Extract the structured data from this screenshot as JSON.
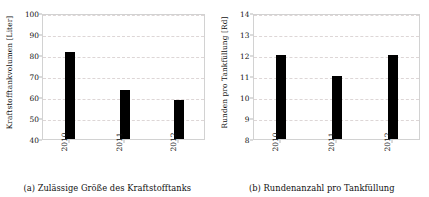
{
  "figure": {
    "background": "#ffffff",
    "bar_color": "#000000",
    "grid_color": "#ddd6d6",
    "frame_color": "#d2d2d2"
  },
  "subfigures": [
    {
      "id": "subfigure-a",
      "caption": "(a) Zulässige Größe des Kraftstofftanks",
      "chart_data": {
        "type": "bar",
        "title": "",
        "xlabel": "",
        "ylabel": "Kraftstofftankvolumen [Liter]",
        "categories": [
          "2010",
          "2011",
          "2012"
        ],
        "values": [
          81.5,
          63.5,
          58.5
        ],
        "ylim": [
          40,
          100
        ],
        "yticks": [
          40,
          50,
          60,
          70,
          80,
          90,
          100
        ],
        "yticklabels": [
          "40",
          "50",
          "60",
          "70",
          "80",
          "90",
          "100"
        ],
        "grid": true,
        "legend": "none"
      }
    },
    {
      "id": "subfigure-b",
      "caption": "(b) Rundenanzahl pro Tankfüllung",
      "chart_data": {
        "type": "bar",
        "title": "",
        "xlabel": "",
        "ylabel": "Runden pro Tankfüllung [Rd]",
        "categories": [
          "2010",
          "2011",
          "2012"
        ],
        "values": [
          12,
          11,
          12
        ],
        "ylim": [
          8,
          14
        ],
        "yticks": [
          8,
          9,
          10,
          11,
          12,
          13,
          14
        ],
        "yticklabels": [
          "8",
          "9",
          "10",
          "11",
          "12",
          "13",
          "14"
        ],
        "grid": true,
        "legend": "none"
      }
    }
  ]
}
